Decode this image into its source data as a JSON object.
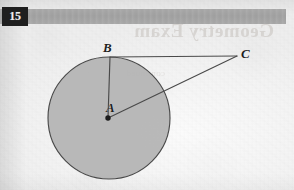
{
  "page": {
    "background_color": "#f2f2f2",
    "paper_tone": "#f4f4f4"
  },
  "header": {
    "band_color": "#a4a4a4",
    "badge": {
      "number": "15",
      "background_color": "#1f1f1f",
      "text_color": "#f0f0f0"
    },
    "bleed_through_title": "Geometry Exam",
    "bleed_through_subtitle": "continued"
  },
  "figure": {
    "type": "circle-with-external-point",
    "stroke_color": "#4a4a4a",
    "fill_color": "#b3b3b3",
    "circle": {
      "center_label": "A",
      "center_x": 109,
      "center_y": 118,
      "radius": 61
    },
    "points": [
      {
        "label": "B",
        "x": 110,
        "y": 57,
        "on_circle": true
      },
      {
        "label": "A",
        "x": 108,
        "y": 118,
        "on_circle": false,
        "is_center": true
      },
      {
        "label": "C",
        "x": 237,
        "y": 56,
        "on_circle": false,
        "is_external": true
      }
    ],
    "segments": [
      {
        "name": "AB",
        "from": "A",
        "to": "B",
        "description": "radius"
      },
      {
        "name": "BC",
        "from": "B",
        "to": "C",
        "description": "tangent"
      },
      {
        "name": "AC",
        "from": "A",
        "to": "C",
        "description": "hypotenuse"
      }
    ],
    "labels": {
      "a": "A",
      "b": "B",
      "c": "C"
    }
  }
}
